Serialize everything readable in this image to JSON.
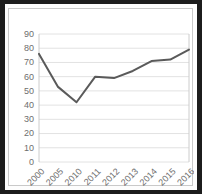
{
  "chart_data": {
    "type": "line",
    "title": "",
    "subtitle": "",
    "xlabel": "",
    "ylabel": "",
    "categories": [
      "2000",
      "2005",
      "2010",
      "2011",
      "2012",
      "2013",
      "2014",
      "2015",
      "2016"
    ],
    "values": [
      76,
      53,
      42,
      60,
      59,
      64,
      71,
      72,
      79
    ],
    "series": [
      {
        "name": "",
        "values": [
          76,
          53,
          42,
          60,
          59,
          64,
          71,
          72,
          79
        ]
      }
    ],
    "ylim": [
      0,
      90
    ],
    "yticks": [
      0,
      10,
      20,
      30,
      40,
      50,
      60,
      70,
      80,
      90
    ],
    "ytick_labels": [
      "0",
      "10",
      "20",
      "30",
      "40",
      "50",
      "60",
      "70",
      "80",
      "90"
    ],
    "xtick_labels": [
      "2000",
      "2005",
      "2010",
      "2011",
      "2012",
      "2013",
      "2014",
      "2015",
      "2016"
    ],
    "xtick_rotation": 45,
    "grid": "horizontal",
    "legend": "none",
    "line_color": "#5a5a5a",
    "grid_color": "#e2e2e2",
    "tick_label_color": "#6e6e6e",
    "plot_background": "#ffffff",
    "frame_color": "#c9c9c9",
    "page_border_color": "#1c1c1c"
  }
}
